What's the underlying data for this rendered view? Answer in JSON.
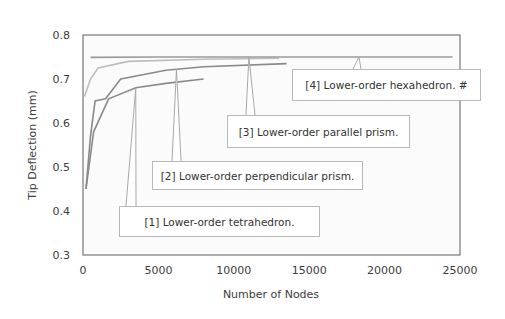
{
  "chart_data": {
    "type": "line",
    "title": "",
    "xlabel": "Number of Nodes",
    "ylabel": "Tip Deflection (mm)",
    "xlim": [
      0,
      25000
    ],
    "ylim": [
      0.3,
      0.8
    ],
    "xticks": [
      0,
      5000,
      10000,
      15000,
      20000,
      25000
    ],
    "xtick_labels": [
      "0",
      "5000",
      "10000",
      "15000",
      "20000",
      "25000"
    ],
    "yticks": [
      0.3,
      0.4,
      0.5,
      0.6,
      0.7,
      0.8
    ],
    "ytick_labels": [
      "0.3",
      "0.4",
      "0.5",
      "0.6",
      "0.7",
      "0.8"
    ],
    "grid": false,
    "legend": "callouts",
    "series": [
      {
        "name": "[1] Lower-order tetrahedron.",
        "color": "#8a8a8a",
        "x": [
          200,
          700,
          1700,
          3500,
          5500,
          8000
        ],
        "y": [
          0.45,
          0.58,
          0.655,
          0.68,
          0.69,
          0.7
        ]
      },
      {
        "name": "[2] Lower-order perpendicular prism.",
        "color": "#8a8a8a",
        "x": [
          200,
          500,
          800,
          1500,
          2500,
          5500,
          8000,
          13500
        ],
        "y": [
          0.45,
          0.57,
          0.65,
          0.655,
          0.7,
          0.72,
          0.728,
          0.735
        ]
      },
      {
        "name": "[3] Lower-order parallel prism.",
        "color": "#bdbdbd",
        "x": [
          100,
          500,
          1000,
          3000,
          8000,
          13000
        ],
        "y": [
          0.66,
          0.7,
          0.725,
          0.74,
          0.745,
          0.747
        ]
      },
      {
        "name": "[4] Lower-order hexahedron. #",
        "color": "#9a9a9a",
        "x": [
          500,
          5000,
          10000,
          15000,
          20000,
          24500
        ],
        "y": [
          0.749,
          0.75,
          0.75,
          0.75,
          0.75,
          0.75
        ]
      }
    ],
    "annotations": [
      {
        "label": "[1] Lower-order tetrahedron.",
        "points_to": {
          "x": 3500,
          "y": 0.68
        }
      },
      {
        "label": "[2] Lower-order perpendicular prism.",
        "points_to": {
          "x": 6200,
          "y": 0.722
        }
      },
      {
        "label": "[3] Lower-order parallel prism.",
        "points_to": {
          "x": 11000,
          "y": 0.75
        }
      },
      {
        "label": "[4] Lower-order hexahedron. #",
        "points_to": {
          "x": 18300,
          "y": 0.75
        }
      }
    ]
  },
  "labels": {
    "xlabel": "Number of Nodes",
    "ylabel": "Tip Deflection (mm)",
    "c1": "[1] Lower-order tetrahedron.",
    "c2": "[2] Lower-order perpendicular prism.",
    "c3": "[3] Lower-order parallel prism.",
    "c4": "[4] Lower-order hexahedron. #"
  }
}
